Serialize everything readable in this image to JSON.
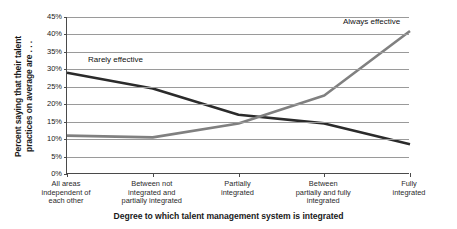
{
  "chart_data": {
    "type": "line",
    "title": "",
    "xlabel": "Degree to which talent management system is integrated",
    "ylabel": "Percent saying that their talent practices on average are . . .",
    "ylabel_lines": [
      "Percent saying that their talent",
      "practices on average are . . ."
    ],
    "categories": [
      "All areas independent of each other",
      "Between not integrated and partially integrated",
      "Partially integrated",
      "Between partially and fully integrated",
      "Fully integrated"
    ],
    "category_lines": [
      [
        "All areas",
        "independent of",
        "each other"
      ],
      [
        "Between not",
        "integrated and",
        "partially integrated"
      ],
      [
        "Partially",
        "integrated"
      ],
      [
        "Between",
        "partially and fully",
        "integrated"
      ],
      [
        "Fully",
        "integrated"
      ]
    ],
    "series": [
      {
        "name": "Rarely effective",
        "color": "#2b2b2b",
        "values": [
          29,
          24.5,
          17,
          14.5,
          8.5
        ]
      },
      {
        "name": "Always effective",
        "color": "#808080",
        "values": [
          11,
          10.5,
          14.5,
          22.5,
          41
        ]
      }
    ],
    "ylim": [
      0,
      45
    ],
    "ytick_values": [
      0,
      5,
      10,
      15,
      20,
      25,
      30,
      35,
      40,
      45
    ],
    "ytick_labels": [
      "0%",
      "5%",
      "10%",
      "15%",
      "20%",
      "25%",
      "30%",
      "35%",
      "40%",
      "45%"
    ],
    "grid": true,
    "legend": "inline-annotations",
    "legend_position": "none",
    "annotations": [
      {
        "text": "Rarely effective",
        "series": "Rarely effective"
      },
      {
        "text": "Always effective",
        "series": "Always effective"
      }
    ]
  }
}
